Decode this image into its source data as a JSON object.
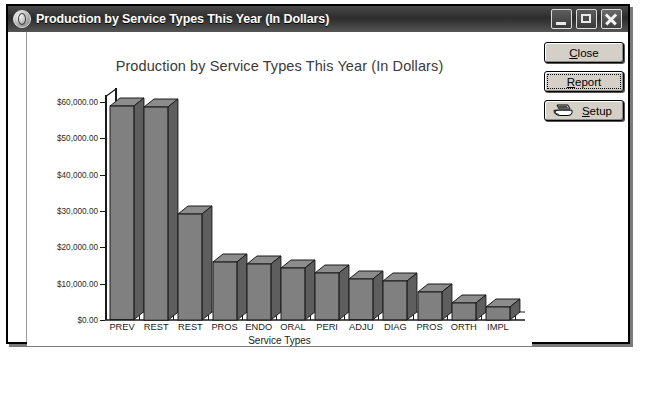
{
  "window": {
    "title": "Production by Service Types This Year (In Dollars)",
    "icon": "app-globe-icon",
    "controls": {
      "minimize": "Minimize",
      "maximize": "Maximize",
      "close": "Close"
    }
  },
  "buttons": [
    {
      "name": "close-button",
      "label": "Close",
      "accel": "C",
      "focused": false,
      "icon": null
    },
    {
      "name": "report-button",
      "label": "Report",
      "accel": "R",
      "focused": true,
      "icon": null
    },
    {
      "name": "setup-button",
      "label": "Setup",
      "accel": "S",
      "focused": false,
      "icon": "printer-icon"
    }
  ],
  "chart_data": {
    "type": "bar",
    "title": "Production by Service Types This Year (In Dollars)",
    "xlabel": "Service Types",
    "ylabel": "",
    "categories": [
      "PREV",
      "REST",
      "REST",
      "PROS",
      "ENDO",
      "ORAL",
      "PERI",
      "ADJU",
      "DIAG",
      "PROS",
      "ORTH",
      "IMPL"
    ],
    "values": [
      58800,
      58700,
      29200,
      16000,
      15400,
      14300,
      12900,
      11200,
      10700,
      7700,
      4700,
      3600
    ],
    "ytick_labels": [
      "$60,000.00",
      "$50,000.00",
      "$40,000.00",
      "$30,000.00",
      "$20,000.00",
      "$10,000.00",
      "$0.00"
    ],
    "ytick_values": [
      60000,
      50000,
      40000,
      30000,
      20000,
      10000,
      0
    ],
    "ylim": [
      0,
      60000
    ],
    "grid": false,
    "legend": false,
    "bar_color": "#808080",
    "bar_side_color": "#5e5e5e",
    "bar_top_color": "#8c8c8c",
    "axis_color": "#1a1a1a",
    "plot_background": "#ffffff"
  }
}
